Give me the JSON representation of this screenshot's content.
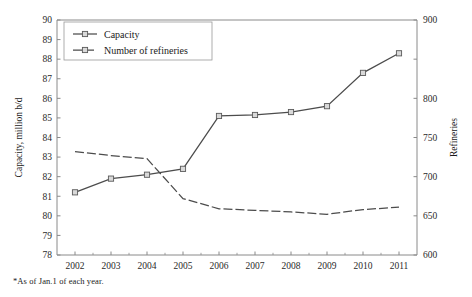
{
  "chart_data": {
    "type": "line",
    "title": "",
    "subtitle": "",
    "xlabel": "",
    "ylabel": "Capacity, million b/d",
    "y2label": "Refineries",
    "categories": [
      "2002",
      "2003",
      "2004",
      "2005",
      "2006",
      "2007",
      "2008",
      "2009",
      "2010",
      "2011"
    ],
    "x": [
      2002,
      2003,
      2004,
      2005,
      2006,
      2007,
      2008,
      2009,
      2010,
      2011
    ],
    "ylim": [
      78,
      90
    ],
    "y2lim": [
      600,
      900
    ],
    "yticks": [
      78,
      79,
      80,
      81,
      82,
      83,
      84,
      85,
      86,
      87,
      88,
      89,
      90
    ],
    "ytick_labels": [
      "78",
      "79",
      "80",
      "81",
      "82",
      "83",
      "84",
      "85",
      "86",
      "87",
      "88",
      "89",
      "90"
    ],
    "y2ticks": [
      600,
      650,
      700,
      750,
      800,
      850,
      900
    ],
    "y2tick_labels": [
      "600",
      "650",
      "700",
      "750",
      "800",
      "850",
      "900"
    ],
    "y2tick_labels_shown": [
      "600",
      "650",
      "700",
      "750",
      "800",
      "900"
    ],
    "grid": false,
    "legend_position": "top-left",
    "series": [
      {
        "name": "Capacity",
        "axis": "left",
        "style": "solid",
        "marker": "square",
        "values": [
          81.2,
          81.9,
          82.1,
          82.4,
          85.1,
          85.15,
          85.3,
          85.6,
          87.3,
          88.3
        ]
      },
      {
        "name": "Number of refineries",
        "axis": "right",
        "style": "dashed",
        "marker": "none",
        "values": [
          732,
          727,
          723,
          672,
          659,
          657,
          655,
          652,
          658,
          661
        ]
      }
    ],
    "annotations": [
      "*As of Jan.1 of each year."
    ],
    "footnote": "*As of Jan.1 of each year."
  },
  "legend": {
    "items": [
      {
        "label": "Capacity"
      },
      {
        "label": "Number of refineries"
      }
    ]
  },
  "axes": {
    "left_title": "Capacity, million b/d",
    "right_title": "Refineries"
  },
  "colors": {
    "line": "#4c4c4c",
    "marker_fill": "#d9d9d9",
    "marker_stroke": "#5a5a5a",
    "axis": "#8a8a8a",
    "text": "#1a1a1a",
    "background": "#ffffff"
  }
}
